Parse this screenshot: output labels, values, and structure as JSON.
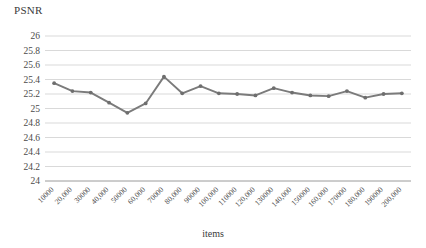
{
  "chart_data": {
    "type": "line",
    "title": "",
    "ylabel": "PSNR",
    "xlabel": "items",
    "categories": [
      "10000",
      "20,000",
      "30000",
      "40,000",
      "50000",
      "60,000",
      "70000",
      "80,000",
      "90000",
      "100,000",
      "110000",
      "120,000",
      "130000",
      "140,000",
      "150000",
      "160,000",
      "170000",
      "180,000",
      "190000",
      "200,000"
    ],
    "values": [
      25.35,
      25.24,
      25.22,
      25.08,
      24.94,
      25.07,
      25.44,
      25.21,
      25.31,
      25.21,
      25.2,
      25.18,
      25.28,
      25.22,
      25.18,
      25.17,
      25.24,
      25.15,
      25.2,
      25.21
    ],
    "ylim": [
      24,
      26
    ],
    "ytick_labels": [
      "26",
      "25.8",
      "25.6",
      "25.4",
      "25.2",
      "25",
      "24.8",
      "24.6",
      "24.4",
      "24.2",
      "24"
    ],
    "ytick_values": [
      26,
      25.8,
      25.6,
      25.4,
      25.2,
      25,
      24.8,
      24.6,
      24.4,
      24.2,
      24
    ],
    "grid": true,
    "legend": "none",
    "series_color": "#7b7b7b",
    "grid_color": "#c9c9c9",
    "marker": "circle"
  }
}
